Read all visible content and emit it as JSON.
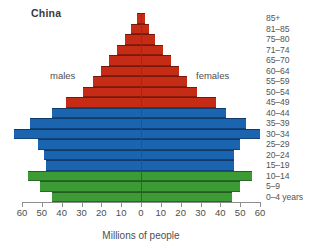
{
  "chart_data": {
    "type": "bar",
    "subtype": "population-pyramid",
    "title": "China",
    "xlabel": "Millions of people",
    "ylabel": "",
    "grid": false,
    "legend_position": "inline",
    "axis": {
      "tick_values": [
        60,
        50,
        40,
        30,
        20,
        10,
        0,
        10,
        20,
        30,
        40,
        50,
        60
      ],
      "tick_labels": [
        "60",
        "50",
        "40",
        "30",
        "20",
        "10",
        "0",
        "10",
        "20",
        "30",
        "40",
        "50",
        "60"
      ],
      "max": 60,
      "min": 0,
      "units": "millions"
    },
    "side_labels": {
      "left": "males",
      "right": "females"
    },
    "categories": [
      "0–4 years",
      "5–9",
      "10–14",
      "15–19",
      "20–24",
      "25–29",
      "30–34",
      "35–39",
      "40–44",
      "45–49",
      "50–54",
      "55–59",
      "60–64",
      "65–70",
      "71–74",
      "75–80",
      "81–85",
      "85+"
    ],
    "series": [
      {
        "name": "males",
        "side": "left",
        "values": [
          45,
          51,
          57,
          48,
          49,
          52,
          64,
          56,
          45,
          38,
          29,
          24,
          20,
          16,
          12,
          8,
          5,
          2
        ]
      },
      {
        "name": "females",
        "side": "right",
        "values": [
          46,
          50,
          56,
          47,
          47,
          50,
          60,
          53,
          43,
          38,
          28,
          23,
          19,
          15,
          11,
          7,
          4,
          2
        ]
      }
    ],
    "band_colors": [
      {
        "name": "children",
        "color": "#3d9b35",
        "categories": [
          "0–4 years",
          "5–9",
          "10–14"
        ]
      },
      {
        "name": "working-age",
        "color": "#1b64b0",
        "categories": [
          "15–19",
          "20–24",
          "25–29",
          "30–34",
          "35–39",
          "40–44"
        ]
      },
      {
        "name": "older",
        "color": "#c62b16",
        "categories": [
          "45–49",
          "50–54",
          "55–59",
          "60–64",
          "65–70",
          "71–74",
          "75–80",
          "81–85",
          "85+"
        ]
      }
    ],
    "colors": {
      "green": "#3d9b35",
      "blue": "#1b64b0",
      "red": "#c62b16",
      "axis": "#8d8d8d",
      "center_axis": "#6d3a34",
      "text": "#4e4e4e"
    }
  }
}
